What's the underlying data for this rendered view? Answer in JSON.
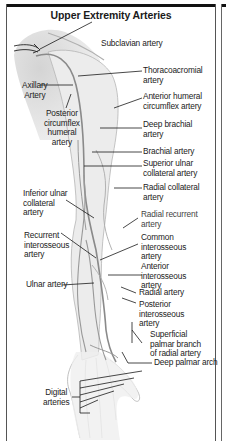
{
  "title": "Upper Extremity Arteries",
  "labels": {
    "subclavian": "Subclavian artery",
    "thoracoacromial": "Thoracoacromial\nartery",
    "anterior_humeral": "Anterior humeral\ncircumflex artery",
    "axillary": "Axillary\nArtery",
    "posterior_circumflex": "Posterior\ncircumflex\nhumeral\nartery",
    "deep_brachial": "Deep brachial\nartery",
    "brachial": "Brachial artery",
    "superior_ulnar": "Superior ulnar\ncollateral artery",
    "radial_collateral": "Radial collateral\nartery",
    "inferior_ulnar": "Inferior ulnar\ncollateral\nartery",
    "radial_recurrent": "Radial recurrent\nartery",
    "recurrent_interosseous": "Recurrent\ninterosseous\nartery",
    "common_interosseous": "Common\ninterosseous\nartery",
    "anterior_interosseous": "Anterior\ninterosseous\nartery",
    "ulnar": "Ulnar artery",
    "radial": "Radial artery",
    "posterior_interosseous": "Posterior\ninterosseous\nartery",
    "superficial_palmar": "Superficial\npalmar branch\nof radial artery",
    "deep_palmar_arch": "Deep palmar arch",
    "digital": "Digital\narteries"
  },
  "colors": {
    "frame": "#111111",
    "skin_shade": "#d9d9d9",
    "artery": "#8a8a8a",
    "leader": "#1a1a1a"
  }
}
